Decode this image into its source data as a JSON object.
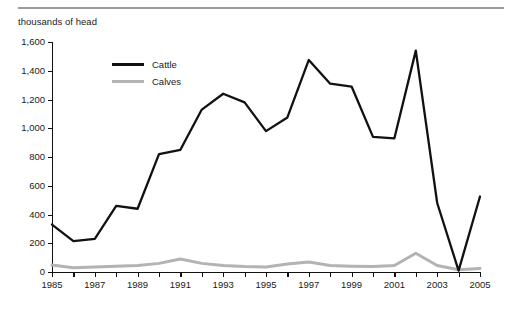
{
  "caption": "thousands of head",
  "legend": {
    "position": "inside-top-left",
    "entries": [
      {
        "label": "Cattle",
        "color": "#111111",
        "icon": "line-swatch-icon"
      },
      {
        "label": "Calves",
        "color": "#b3b3b3",
        "icon": "line-swatch-icon"
      }
    ]
  },
  "chart_data": {
    "type": "line",
    "title": "",
    "subtitle": "",
    "xlabel": "",
    "ylabel": "thousands of head",
    "grid": false,
    "legend_position": "inside-top-left",
    "xlim": [
      1985,
      2005
    ],
    "ylim": [
      0,
      1600
    ],
    "ytick_step": 200,
    "yticks": [
      0,
      200,
      400,
      600,
      800,
      1000,
      1200,
      1400,
      1600
    ],
    "ytick_labels": [
      "0",
      "200",
      "400",
      "600",
      "800",
      "1,000",
      "1,200",
      "1,400",
      "1,600"
    ],
    "x": [
      1985,
      1986,
      1987,
      1988,
      1989,
      1990,
      1991,
      1992,
      1993,
      1994,
      1995,
      1996,
      1997,
      1998,
      1999,
      2000,
      2001,
      2002,
      2003,
      2004,
      2005
    ],
    "xticks": [
      1985,
      1986,
      1987,
      1988,
      1989,
      1990,
      1991,
      1992,
      1993,
      1994,
      1995,
      1996,
      1997,
      1998,
      1999,
      2000,
      2001,
      2002,
      2003,
      2004,
      2005
    ],
    "xtick_labels": [
      "1985",
      "",
      "1987",
      "",
      "1989",
      "",
      "1991",
      "",
      "1993",
      "",
      "1995",
      "",
      "1997",
      "",
      "1999",
      "",
      "2001",
      "",
      "2003",
      "",
      "2005"
    ],
    "series": [
      {
        "name": "Cattle",
        "color": "#111111",
        "width": 2.3,
        "values": [
          330,
          215,
          230,
          460,
          440,
          820,
          850,
          1130,
          1240,
          1180,
          980,
          1075,
          1475,
          1310,
          1290,
          940,
          930,
          1540,
          480,
          10,
          525
        ]
      },
      {
        "name": "Calves",
        "color": "#b3b3b3",
        "width": 3.0,
        "values": [
          48,
          30,
          35,
          40,
          45,
          60,
          90,
          60,
          45,
          38,
          35,
          55,
          70,
          45,
          40,
          38,
          45,
          130,
          45,
          15,
          25
        ]
      }
    ]
  }
}
